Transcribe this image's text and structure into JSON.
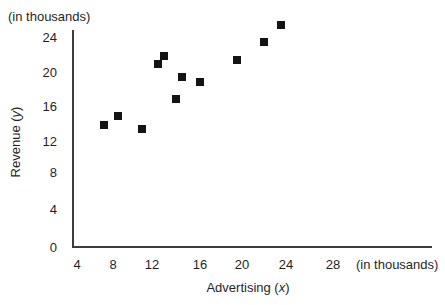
{
  "chart_data": {
    "type": "scatter",
    "title": "",
    "xlabel": {
      "pre": "Advertising (",
      "var": "x",
      "post": ")"
    },
    "ylabel": {
      "pre": "Revenue (",
      "var": "y",
      "post": ")"
    },
    "x_unit_label": "(in thousands)",
    "y_unit_label": "(in thousands)",
    "x_ticks": [
      4,
      8,
      12,
      16,
      20,
      24,
      28
    ],
    "y_ticks": [
      0,
      4,
      8,
      12,
      16,
      20,
      24
    ],
    "xlim": [
      4,
      30
    ],
    "ylim": [
      0,
      26
    ],
    "grid": false,
    "legend": "none",
    "marker": "filled-square",
    "marker_color": "#141414",
    "points": [
      {
        "x": 7,
        "y": 14
      },
      {
        "x": 8.5,
        "y": 15
      },
      {
        "x": 11,
        "y": 13.5
      },
      {
        "x": 12.5,
        "y": 21
      },
      {
        "x": 13,
        "y": 22
      },
      {
        "x": 14,
        "y": 17
      },
      {
        "x": 14.5,
        "y": 19.5
      },
      {
        "x": 16,
        "y": 19
      },
      {
        "x": 19.5,
        "y": 21.5
      },
      {
        "x": 22,
        "y": 23.5
      },
      {
        "x": 23.5,
        "y": 25.5
      }
    ]
  }
}
